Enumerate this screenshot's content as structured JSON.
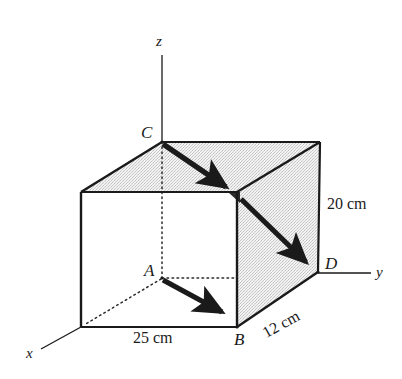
{
  "figure": {
    "kind": "geometry-diagram",
    "background_color": "#ffffff",
    "ink_color": "#1a1a1a",
    "shade_color": "#e4e4e4",
    "axes": [
      {
        "name": "z-axis",
        "label": "z"
      },
      {
        "name": "y-axis",
        "label": "y"
      },
      {
        "name": "x-axis",
        "label": "x"
      }
    ],
    "vertices": [
      {
        "name": "point-a",
        "label": "A"
      },
      {
        "name": "point-b",
        "label": "B"
      },
      {
        "name": "point-c",
        "label": "C"
      },
      {
        "name": "point-d",
        "label": "D"
      }
    ],
    "dimensions": [
      {
        "name": "height-dimension",
        "label": "20 cm",
        "edge": "vertical-right"
      },
      {
        "name": "width-dimension",
        "label": "25 cm",
        "edge": "bottom-front"
      },
      {
        "name": "depth-dimension",
        "label": "12 cm",
        "edge": "bottom-right-receding"
      }
    ],
    "vectors": [
      {
        "name": "vector-ab",
        "from": "A",
        "to": "B"
      },
      {
        "name": "vector-cb",
        "from": "C",
        "to": "mid-top-front-right"
      },
      {
        "name": "vector-mid-d",
        "from": "mid-top-front-right",
        "to": "D"
      }
    ],
    "labels": {
      "z": "z",
      "y": "y",
      "x": "x",
      "A": "A",
      "B": "B",
      "C": "C",
      "D": "D",
      "height": "20 cm",
      "width": "25 cm",
      "depth": "12 cm"
    }
  }
}
